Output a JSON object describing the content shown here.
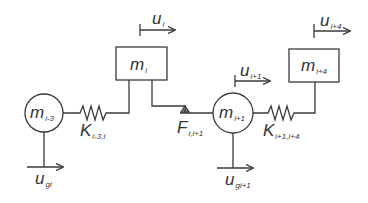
{
  "diagram": {
    "type": "mass-spring-friction model",
    "masses": [
      {
        "id": "m_i_minus_3",
        "base": "m",
        "sub": "i-3",
        "shape": "circle"
      },
      {
        "id": "m_i",
        "base": "m",
        "sub": "i",
        "shape": "box"
      },
      {
        "id": "m_i_plus_1",
        "base": "m",
        "sub": "i+1",
        "shape": "circle"
      },
      {
        "id": "m_i_plus_4",
        "base": "m",
        "sub": "i+4",
        "shape": "box"
      }
    ],
    "springs": [
      {
        "id": "K_i_minus_3_i",
        "base": "K",
        "sub": "i-3,i"
      },
      {
        "id": "K_i_plus_1_i_plus_4",
        "base": "K",
        "sub": "i+1,i+4"
      }
    ],
    "friction": {
      "id": "F_i_i_plus_1",
      "base": "F",
      "sub": "i,i+1"
    },
    "displacements": [
      {
        "id": "u_i",
        "base": "u",
        "sub": "i"
      },
      {
        "id": "u_i_plus_1",
        "base": "u",
        "sub": "i+1"
      },
      {
        "id": "u_i_plus_4",
        "base": "u",
        "sub": "i+4"
      },
      {
        "id": "u_gi",
        "base": "u",
        "sub": "gi"
      },
      {
        "id": "u_gi_plus_1",
        "base": "u",
        "sub": "gi+1"
      }
    ],
    "colors": {
      "stroke": "#3a3a3a",
      "text": "#333333",
      "background": "#ffffff"
    }
  }
}
